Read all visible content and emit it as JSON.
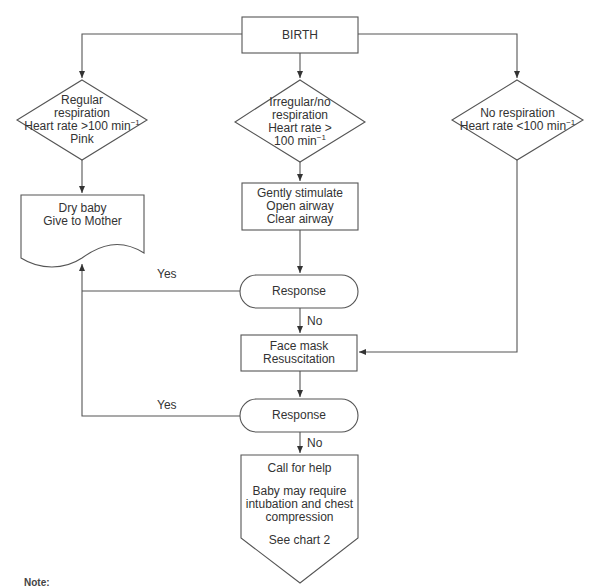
{
  "diagram": {
    "type": "flowchart",
    "colors": {
      "stroke": "#555555",
      "text": "#333333",
      "background": "#ffffff"
    },
    "nodes": {
      "birth": {
        "shape": "rectangle",
        "lines": [
          "BIRTH"
        ]
      },
      "regular": {
        "shape": "diamond",
        "lines": [
          "Regular",
          "respiration",
          "Heart rate >100 min",
          "Pink"
        ],
        "superscript": "−1"
      },
      "irregular": {
        "shape": "diamond",
        "lines": [
          "Irregular/no",
          "respiration",
          "Heart rate >",
          "100 min"
        ],
        "superscript": "−1"
      },
      "none": {
        "shape": "diamond",
        "lines": [
          "No respiration",
          "Heart rate <100 min"
        ],
        "superscript": "−1"
      },
      "dry_baby": {
        "shape": "document",
        "lines": [
          "Dry baby",
          "Give to Mother"
        ]
      },
      "stimulate": {
        "shape": "rectangle",
        "lines": [
          "Gently stimulate",
          "Open airway",
          "Clear airway"
        ]
      },
      "response1": {
        "shape": "terminator",
        "lines": [
          "Response"
        ]
      },
      "face_mask": {
        "shape": "rectangle",
        "lines": [
          "Face mask",
          "Resuscitation"
        ]
      },
      "response2": {
        "shape": "terminator",
        "lines": [
          "Response"
        ]
      },
      "call_help": {
        "shape": "off-page-connector",
        "lines": [
          "Call for help",
          "",
          "Baby may require",
          "intubation and chest",
          "compression",
          "",
          "See chart 2"
        ]
      }
    },
    "edges": [
      {
        "from": "birth",
        "to": "regular"
      },
      {
        "from": "birth",
        "to": "irregular"
      },
      {
        "from": "birth",
        "to": "none"
      },
      {
        "from": "regular",
        "to": "dry_baby"
      },
      {
        "from": "irregular",
        "to": "stimulate"
      },
      {
        "from": "stimulate",
        "to": "response1"
      },
      {
        "from": "response1",
        "to": "dry_baby",
        "label": "Yes"
      },
      {
        "from": "response1",
        "to": "face_mask",
        "label": "No"
      },
      {
        "from": "none",
        "to": "face_mask"
      },
      {
        "from": "face_mask",
        "to": "response2"
      },
      {
        "from": "response2",
        "to": "dry_baby",
        "label": "Yes"
      },
      {
        "from": "response2",
        "to": "call_help",
        "label": "No"
      }
    ],
    "edge_labels": {
      "yes1": "Yes",
      "no1": "No",
      "yes2": "Yes",
      "no2": "No"
    },
    "footnote": {
      "prefix": "Note:",
      "text": "(footnote text cut off at image edge — illegible)"
    }
  }
}
